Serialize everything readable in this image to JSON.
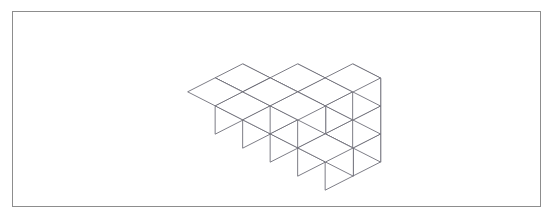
{
  "figure": {
    "kind": "isometric-cube-stack",
    "title": "",
    "caption": "",
    "frame": {
      "border_color": "#8d8d8d",
      "background_color": "#ffffff",
      "x": 12,
      "y": 11,
      "width": 529,
      "height": 196
    },
    "style": {
      "line_color": "#6e6e78",
      "face_color": "#ffffff",
      "line_width": 0.9
    },
    "projection": {
      "type": "isometric",
      "origin_x": 188,
      "origin_y": 120,
      "half_width": 27.5,
      "half_depth": 14.0,
      "cube_height": 28.0
    },
    "chart_data": {
      "type": "heatmap",
      "title": "Isometric cube stack heights",
      "xlabel": "column (left to right)",
      "ylabel": "row (back to front)",
      "categories": [
        "c0",
        "c1",
        "c2",
        "c3",
        "c4"
      ],
      "rows": [
        "back",
        "front"
      ],
      "heights": [
        [
          1,
          1,
          2,
          2,
          3
        ],
        [
          1,
          1,
          2,
          2,
          1
        ]
      ],
      "total_cubes": 16,
      "grid": false,
      "legend": "none"
    }
  }
}
